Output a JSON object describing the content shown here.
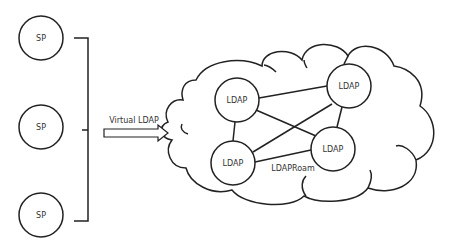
{
  "diagram": {
    "service_providers": [
      {
        "label": "SP",
        "cx": 41,
        "cy": 38
      },
      {
        "label": "SP",
        "cx": 41,
        "cy": 127
      },
      {
        "label": "SP",
        "cx": 41,
        "cy": 215
      }
    ],
    "arrow": {
      "label": "Virtual LDAP"
    },
    "ldap_nodes": [
      {
        "label": "LDAP",
        "cx": 237,
        "cy": 100
      },
      {
        "label": "LDAP",
        "cx": 349,
        "cy": 86
      },
      {
        "label": "LDAP",
        "cx": 233,
        "cy": 163
      },
      {
        "label": "LDAP",
        "cx": 333,
        "cy": 149
      }
    ],
    "connections": [
      [
        0,
        1
      ],
      [
        0,
        2
      ],
      [
        0,
        3
      ],
      [
        1,
        2
      ],
      [
        1,
        3
      ],
      [
        2,
        3
      ]
    ],
    "cloud_label": "LDAPRoam",
    "colors": {
      "stroke": "#222222",
      "text": "#333333",
      "background": "#ffffff"
    }
  }
}
